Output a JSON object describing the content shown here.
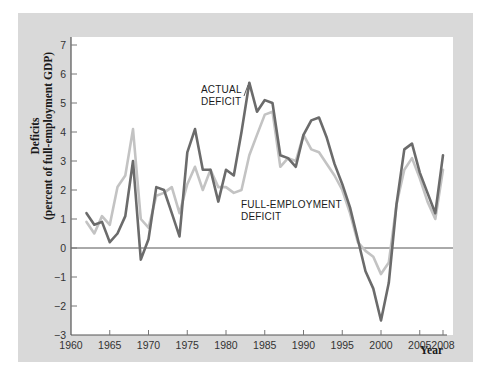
{
  "chart_data": {
    "type": "line",
    "title": "",
    "xlabel": "Year",
    "ylabel": "Deficits (percent of full-employment GDP)",
    "ylabel_lines": [
      "Deficits",
      "(percent of full-employment GDP)"
    ],
    "xlim": [
      1960,
      2008
    ],
    "ylim": [
      -3,
      7
    ],
    "x_ticks": [
      1960,
      1965,
      1970,
      1975,
      1980,
      1985,
      1990,
      1995,
      2000,
      2005,
      2008
    ],
    "y_ticks": [
      -3,
      -2,
      -1,
      0,
      1,
      2,
      3,
      4,
      5,
      6,
      7
    ],
    "grid": false,
    "zero_line": true,
    "annotations": [
      {
        "text_lines": [
          "ACTUAL",
          "DEFICIT"
        ],
        "series": "Actual deficit"
      },
      {
        "text_lines": [
          "FULL-EMPLOYMENT",
          "DEFICIT"
        ],
        "series": "Full-employment deficit"
      }
    ],
    "x": [
      1962,
      1963,
      1964,
      1965,
      1966,
      1967,
      1968,
      1969,
      1970,
      1971,
      1972,
      1973,
      1974,
      1975,
      1976,
      1977,
      1978,
      1979,
      1980,
      1981,
      1982,
      1983,
      1984,
      1985,
      1986,
      1987,
      1988,
      1989,
      1990,
      1991,
      1992,
      1993,
      1994,
      1995,
      1996,
      1997,
      1998,
      1999,
      2000,
      2001,
      2002,
      2003,
      2004,
      2005,
      2006,
      2007,
      2008
    ],
    "series": [
      {
        "name": "Actual deficit",
        "color": "#6b6b6b",
        "values": [
          1.2,
          0.8,
          0.9,
          0.2,
          0.5,
          1.1,
          3.0,
          -0.4,
          0.3,
          2.1,
          2.0,
          1.2,
          0.4,
          3.3,
          4.1,
          2.7,
          2.7,
          1.6,
          2.7,
          2.5,
          4.0,
          5.7,
          4.7,
          5.1,
          5.0,
          3.2,
          3.1,
          2.8,
          3.9,
          4.4,
          4.5,
          3.8,
          2.9,
          2.2,
          1.4,
          0.3,
          -0.8,
          -1.4,
          -2.5,
          -1.2,
          1.5,
          3.4,
          3.6,
          2.6,
          1.9,
          1.2,
          3.2
        ]
      },
      {
        "name": "Full-employment deficit",
        "color": "#c3c3c3",
        "values": [
          0.9,
          0.5,
          1.1,
          0.8,
          2.1,
          2.5,
          4.1,
          1.0,
          0.7,
          1.8,
          1.9,
          2.1,
          1.2,
          2.2,
          2.8,
          2.0,
          2.7,
          2.1,
          2.1,
          1.9,
          2.0,
          3.2,
          3.9,
          4.6,
          4.7,
          2.8,
          3.1,
          3.0,
          3.9,
          3.4,
          3.3,
          2.9,
          2.5,
          2.0,
          1.2,
          0.2,
          -0.1,
          -0.3,
          -0.9,
          -0.5,
          1.5,
          2.7,
          3.1,
          2.4,
          1.6,
          1.0,
          2.7
        ]
      }
    ]
  },
  "labels": {
    "ylabel_line1": "Deficits",
    "ylabel_line2": "(percent of full-employment GDP)",
    "xlabel": "Year",
    "actual_line1": "ACTUAL",
    "actual_line2": "DEFICIT",
    "fe_line1": "FULL-EMPLOYMENT",
    "fe_line2": "DEFICIT"
  }
}
